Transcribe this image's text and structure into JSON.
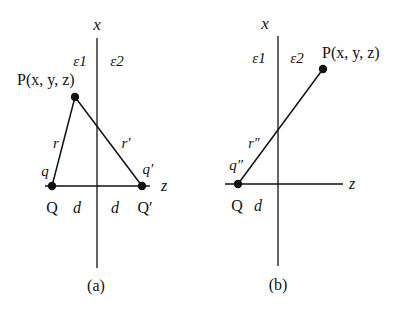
{
  "figure": {
    "panels": [
      {
        "id": "a",
        "caption": "(a)",
        "axis_vertical_label": "x",
        "axis_horizontal_label": "z",
        "medium_left": "ε1",
        "medium_right": "ε2",
        "point_label": "P(x, y, z)",
        "charges": [
          {
            "name": "Q",
            "charge_label": "q"
          },
          {
            "name": "Q′",
            "charge_label": "q′"
          }
        ],
        "distances": [
          "r",
          "r′"
        ],
        "offsets": [
          "d",
          "d"
        ]
      },
      {
        "id": "b",
        "caption": "(b)",
        "axis_vertical_label": "x",
        "axis_horizontal_label": "z",
        "medium_left": "ε1",
        "medium_right": "ε2",
        "point_label": "P(x, y, z)",
        "charges": [
          {
            "name": "Q",
            "charge_label": "q″"
          }
        ],
        "distances": [
          "r″"
        ],
        "offsets": [
          "d"
        ]
      }
    ],
    "colors": {
      "ink": "#111111",
      "background": "#ffffff"
    }
  }
}
